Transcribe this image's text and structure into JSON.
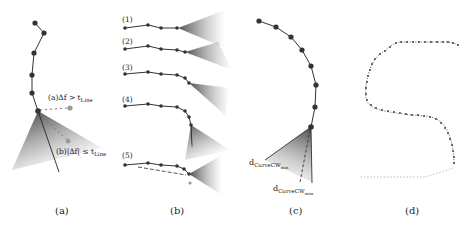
{
  "figure": {
    "panels": [
      {
        "id": "a",
        "caption": "(a)",
        "annotations": {
          "above": "(a)Δf > t",
          "above_sub": "Line",
          "below": "(b)|Δf| ≤ t",
          "below_sub": "Line"
        }
      },
      {
        "id": "b",
        "caption": "(b)",
        "steps": [
          "(1)",
          "(2)",
          "(3)",
          "(4)",
          "(5)"
        ]
      },
      {
        "id": "c",
        "caption": "(c)",
        "annotations": {
          "min_label": "d",
          "min_sub": "CurveCW",
          "min_subsub": "min",
          "max_label": "d",
          "max_sub": "CurveCW",
          "max_subsub": "max"
        }
      },
      {
        "id": "d",
        "caption": "(d)"
      }
    ],
    "colors": {
      "node": "#333333",
      "line": "#333333",
      "cone_dark": "#555555",
      "predicted": "#999999"
    }
  }
}
